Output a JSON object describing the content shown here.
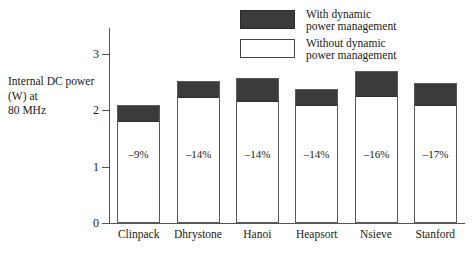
{
  "chart_data": {
    "type": "bar",
    "subtype": "stacked",
    "title": "",
    "xlabel": "",
    "ylabel": "Internal DC power (W) at 80 MHz",
    "ylabel_lines": [
      "Internal DC power",
      "(W) at",
      "80 MHz"
    ],
    "ylim": [
      0,
      3.35
    ],
    "yticks": [
      0,
      1,
      2,
      3
    ],
    "ytick_labels": [
      "0",
      "1",
      "2",
      "3"
    ],
    "grid": false,
    "categories": [
      "Clinpack",
      "Dhrystone",
      "Hanoi",
      "Heapsort",
      "Nsieve",
      "Stanford"
    ],
    "series": [
      {
        "name": "Without dynamic power management",
        "color": "#ffffff",
        "values": [
          1.81,
          2.23,
          2.16,
          2.09,
          2.25,
          2.09
        ]
      },
      {
        "name": "With dynamic power management",
        "color": "#3b3b3b",
        "values": [
          2.09,
          2.51,
          2.57,
          2.37,
          2.69,
          2.48
        ]
      }
    ],
    "bar_totals": [
      2.09,
      2.51,
      2.57,
      2.37,
      2.69,
      2.48
    ],
    "annotations": [
      "–9%",
      "–14%",
      "–14%",
      "–14%",
      "–16%",
      "–17%"
    ],
    "legend": {
      "position": "top-right",
      "entries": [
        {
          "label_lines": [
            "With dynamic",
            "power management"
          ],
          "swatch": "dark"
        },
        {
          "label_lines": [
            "Without dynamic",
            "power management"
          ],
          "swatch": "light"
        }
      ]
    }
  },
  "legend": {
    "entry_with_line1": "With dynamic",
    "entry_with_line2": "power management",
    "entry_without_line1": "Without dynamic",
    "entry_without_line2": "power management"
  },
  "axis": {
    "y_label_line1": "Internal DC power",
    "y_label_line2": "(W) at",
    "y_label_line3": "80 MHz",
    "tick_3": "3",
    "tick_2": "2",
    "tick_1": "1",
    "tick_0": "0"
  },
  "categories": {
    "c0": "Clinpack",
    "c1": "Dhrystone",
    "c2": "Hanoi",
    "c3": "Heapsort",
    "c4": "Nsieve",
    "c5": "Stanford"
  },
  "percents": {
    "p0": "–9%",
    "p1": "–14%",
    "p2": "–14%",
    "p3": "–14%",
    "p4": "–16%",
    "p5": "–17%"
  },
  "colors": {
    "dark_fill": "#3b3b3b",
    "light_fill": "#ffffff",
    "stroke": "#5a5a5a",
    "axis": "#555555",
    "text": "#1a1a1a"
  }
}
